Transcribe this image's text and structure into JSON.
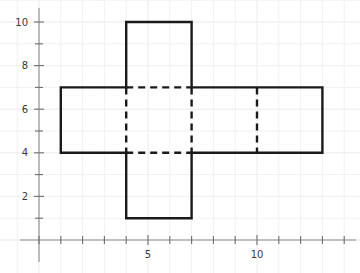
{
  "figure": {
    "title": "",
    "background_color": "#ffffff",
    "grid_color": "#f1f1f1",
    "axis_color": "#8c8c8c",
    "tick_color": "#6e6e6e",
    "label_color": "#3a3a3a",
    "shape_stroke_color": "#1a1a1a",
    "dashed_stroke_color": "#1a1a1a"
  },
  "chart_data": {
    "type": "line",
    "title": "",
    "xlabel": "",
    "ylabel": "",
    "xlim": [
      -1,
      14.6
    ],
    "ylim": [
      -0.6,
      11.0
    ],
    "grid": true,
    "legend": "none",
    "x_ticks": [
      0,
      1,
      2,
      3,
      4,
      5,
      6,
      7,
      8,
      9,
      10,
      11,
      12,
      13,
      14
    ],
    "x_tick_labels": [
      "",
      "",
      "",
      "",
      "",
      "5",
      "",
      "",
      "",
      "",
      "10",
      "",
      "",
      "",
      ""
    ],
    "y_ticks": [
      0,
      1,
      2,
      3,
      4,
      5,
      6,
      7,
      8,
      9,
      10
    ],
    "y_tick_labels": [
      "",
      "",
      "2",
      "",
      "4",
      "",
      "6",
      "",
      "8",
      "",
      "10"
    ],
    "visible_x_labels": [
      "5",
      "10"
    ],
    "visible_y_labels": [
      "2",
      "4",
      "6",
      "8",
      "10"
    ],
    "series": [
      {
        "name": "cube-net-outline",
        "style": "solid",
        "closed": true,
        "points": [
          [
            1,
            7
          ],
          [
            4,
            7
          ],
          [
            4,
            10
          ],
          [
            7,
            10
          ],
          [
            7,
            7
          ],
          [
            13,
            7
          ],
          [
            13,
            4
          ],
          [
            7,
            4
          ],
          [
            7,
            1
          ],
          [
            4,
            1
          ],
          [
            4,
            4
          ],
          [
            1,
            4
          ]
        ]
      },
      {
        "name": "fold-line-horizontal-top",
        "style": "dashed",
        "points": [
          [
            4,
            7
          ],
          [
            7,
            7
          ]
        ]
      },
      {
        "name": "fold-line-horizontal-bottom",
        "style": "dashed",
        "points": [
          [
            4,
            4
          ],
          [
            7,
            4
          ]
        ]
      },
      {
        "name": "fold-line-vertical-left",
        "style": "dashed",
        "points": [
          [
            4,
            7
          ],
          [
            4,
            4
          ]
        ]
      },
      {
        "name": "fold-line-vertical-right",
        "style": "dashed",
        "points": [
          [
            7,
            7
          ],
          [
            7,
            4
          ]
        ]
      },
      {
        "name": "fold-line-vertical-far-right",
        "style": "dashed",
        "points": [
          [
            10,
            7
          ],
          [
            10,
            4
          ]
        ]
      }
    ]
  }
}
